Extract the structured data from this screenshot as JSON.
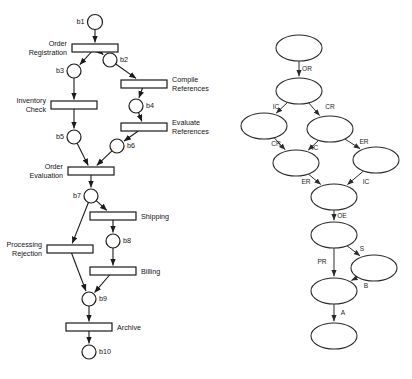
{
  "figure": {
    "kind": "two-panel-diagram",
    "left_panel": {
      "name": "petri-net",
      "title": "Order handling Petri net",
      "places": [
        {
          "id": "b1",
          "label": "b1",
          "cx": 95,
          "cy": 22,
          "r": 7.5,
          "label_side": "left"
        },
        {
          "id": "b2",
          "label": "b2",
          "cx": 110,
          "cy": 60,
          "r": 7.0,
          "label_side": "right"
        },
        {
          "id": "b3",
          "label": "b3",
          "cx": 74,
          "cy": 71,
          "r": 7.0,
          "label_side": "left"
        },
        {
          "id": "b4",
          "label": "b4",
          "cx": 136,
          "cy": 106,
          "r": 7.0,
          "label_side": "right"
        },
        {
          "id": "b5",
          "label": "b5",
          "cx": 74,
          "cy": 137,
          "r": 7.0,
          "label_side": "left"
        },
        {
          "id": "b6",
          "label": "b6",
          "cx": 117,
          "cy": 146,
          "r": 7.0,
          "label_side": "right"
        },
        {
          "id": "b7",
          "label": "b7",
          "cx": 91,
          "cy": 196,
          "r": 7.0,
          "label_side": "left"
        },
        {
          "id": "b8",
          "label": "b8",
          "cx": 113,
          "cy": 241,
          "r": 7.0,
          "label_side": "right"
        },
        {
          "id": "b9",
          "label": "b9",
          "cx": 89,
          "cy": 299,
          "r": 7.0,
          "label_side": "right"
        },
        {
          "id": "b10",
          "label": "b10",
          "cx": 89,
          "cy": 352,
          "r": 7.0,
          "label_side": "right"
        }
      ],
      "transitions": [
        {
          "id": "t_or",
          "label": "Order\nRegistration",
          "label_lines": [
            "Order",
            "Registration"
          ],
          "cx": 95,
          "cy": 48,
          "w": 46,
          "h": 8,
          "label_side": "left"
        },
        {
          "id": "t_cr",
          "label": "Compile\nReferences",
          "label_lines": [
            "Compile",
            "References"
          ],
          "cx": 144,
          "cy": 84,
          "w": 46,
          "h": 8,
          "label_side": "right"
        },
        {
          "id": "t_ic",
          "label": "Inventory\nCheck",
          "label_lines": [
            "Inventory",
            "Check"
          ],
          "cx": 74,
          "cy": 105,
          "w": 46,
          "h": 8,
          "label_side": "left"
        },
        {
          "id": "t_er",
          "label": "Evaluate\nReferences",
          "label_lines": [
            "Evaluate",
            "References"
          ],
          "cx": 144,
          "cy": 127,
          "w": 46,
          "h": 8,
          "label_side": "right"
        },
        {
          "id": "t_oe",
          "label": "Order\nEvaluation",
          "label_lines": [
            "Order",
            "Evaluation"
          ],
          "cx": 91,
          "cy": 171,
          "w": 46,
          "h": 8,
          "label_side": "left"
        },
        {
          "id": "t_sh",
          "label": "Shipping",
          "label_lines": [
            "Shipping"
          ],
          "cx": 113,
          "cy": 216,
          "w": 46,
          "h": 8,
          "label_side": "right"
        },
        {
          "id": "t_pr",
          "label": "Processing\nRejection",
          "label_lines": [
            "Processing",
            "Rejection"
          ],
          "cx": 70,
          "cy": 249,
          "w": 46,
          "h": 8,
          "label_side": "left"
        },
        {
          "id": "t_bi",
          "label": "Billing",
          "label_lines": [
            "Billing"
          ],
          "cx": 113,
          "cy": 271,
          "w": 46,
          "h": 8,
          "label_side": "right"
        },
        {
          "id": "t_ar",
          "label": "Archive",
          "label_lines": [
            "Archive"
          ],
          "cx": 89,
          "cy": 327,
          "w": 46,
          "h": 8,
          "label_side": "right"
        }
      ],
      "arcs": [
        {
          "from": "b1",
          "to": "t_or"
        },
        {
          "from": "t_or",
          "to": "b3"
        },
        {
          "from": "t_or",
          "to": "b2"
        },
        {
          "from": "b2",
          "to": "t_cr"
        },
        {
          "from": "b3",
          "to": "t_ic"
        },
        {
          "from": "t_cr",
          "to": "b4"
        },
        {
          "from": "t_ic",
          "to": "b5"
        },
        {
          "from": "b4",
          "to": "t_er"
        },
        {
          "from": "t_er",
          "to": "b6"
        },
        {
          "from": "b5",
          "to": "t_oe"
        },
        {
          "from": "b6",
          "to": "t_oe"
        },
        {
          "from": "t_oe",
          "to": "b7"
        },
        {
          "from": "b7",
          "to": "t_sh"
        },
        {
          "from": "b7",
          "to": "t_pr"
        },
        {
          "from": "t_sh",
          "to": "b8"
        },
        {
          "from": "b8",
          "to": "t_bi"
        },
        {
          "from": "t_pr",
          "to": "b9"
        },
        {
          "from": "t_bi",
          "to": "b9"
        },
        {
          "from": "b9",
          "to": "t_ar"
        },
        {
          "from": "t_ar",
          "to": "b10"
        }
      ]
    },
    "right_panel": {
      "name": "reachability-graph",
      "title": "Reachability graph",
      "nodes": [
        {
          "id": "m0",
          "cx": 299,
          "cy": 48,
          "rx": 23,
          "ry": 13
        },
        {
          "id": "m1",
          "cx": 299,
          "cy": 91,
          "rx": 23,
          "ry": 13
        },
        {
          "id": "m2",
          "cx": 264,
          "cy": 126,
          "rx": 23,
          "ry": 13
        },
        {
          "id": "m3",
          "cx": 330,
          "cy": 129,
          "rx": 23,
          "ry": 13
        },
        {
          "id": "m4",
          "cx": 296,
          "cy": 163,
          "rx": 23,
          "ry": 13
        },
        {
          "id": "m5",
          "cx": 376,
          "cy": 160,
          "rx": 23,
          "ry": 13
        },
        {
          "id": "m6",
          "cx": 334,
          "cy": 197,
          "rx": 23,
          "ry": 13
        },
        {
          "id": "m7",
          "cx": 334,
          "cy": 235,
          "rx": 23,
          "ry": 13
        },
        {
          "id": "m8",
          "cx": 374,
          "cy": 268,
          "rx": 23,
          "ry": 13
        },
        {
          "id": "m9",
          "cx": 334,
          "cy": 291,
          "rx": 23,
          "ry": 13
        },
        {
          "id": "m10",
          "cx": 334,
          "cy": 336,
          "rx": 23,
          "ry": 13
        }
      ],
      "edges": [
        {
          "from": "m0",
          "to": "m1",
          "label": "OR",
          "lx": 307,
          "ly": 71
        },
        {
          "from": "m1",
          "to": "m2",
          "label": "IC",
          "lx": 276,
          "ly": 109
        },
        {
          "from": "m1",
          "to": "m3",
          "label": "CR",
          "lx": 330,
          "ly": 109
        },
        {
          "from": "m2",
          "to": "m4",
          "label": "CR",
          "lx": 276,
          "ly": 146
        },
        {
          "from": "m3",
          "to": "m4",
          "label": "IC",
          "lx": 315,
          "ly": 150
        },
        {
          "from": "m3",
          "to": "m5",
          "label": "ER",
          "lx": 364,
          "ly": 144
        },
        {
          "from": "m4",
          "to": "m6",
          "label": "ER",
          "lx": 306,
          "ly": 184
        },
        {
          "from": "m5",
          "to": "m6",
          "label": "IC",
          "lx": 366,
          "ly": 184
        },
        {
          "from": "m6",
          "to": "m7",
          "label": "OE",
          "lx": 342,
          "ly": 218
        },
        {
          "from": "m7",
          "to": "m8",
          "label": "S",
          "lx": 362,
          "ly": 251
        },
        {
          "from": "m7",
          "to": "m9",
          "label": "PR",
          "lx": 322,
          "ly": 264
        },
        {
          "from": "m8",
          "to": "m9",
          "label": "B",
          "lx": 366,
          "ly": 288
        },
        {
          "from": "m9",
          "to": "m10",
          "label": "A",
          "lx": 343,
          "ly": 315
        }
      ],
      "edge_label_legend": [
        {
          "code": "OR",
          "meaning": "Order Registration"
        },
        {
          "code": "CR",
          "meaning": "Compile References"
        },
        {
          "code": "IC",
          "meaning": "Inventory Check"
        },
        {
          "code": "ER",
          "meaning": "Evaluate References"
        },
        {
          "code": "OE",
          "meaning": "Order Evaluation"
        },
        {
          "code": "S",
          "meaning": "Shipping"
        },
        {
          "code": "PR",
          "meaning": "Processing Rejection"
        },
        {
          "code": "B",
          "meaning": "Billing"
        },
        {
          "code": "A",
          "meaning": "Archive"
        }
      ]
    },
    "colors": {
      "background": "#ffffff",
      "stroke": "#1a1a1a",
      "node_fill": "#ffffff",
      "text": "#141414"
    }
  }
}
